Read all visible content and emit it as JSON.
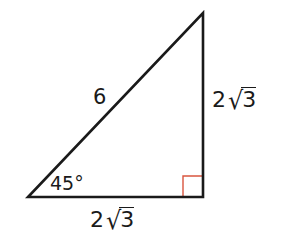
{
  "figure": {
    "type": "right-triangle",
    "vertices": {
      "bottom_left": [
        28,
        197
      ],
      "bottom_right": [
        203,
        197
      ],
      "top": [
        203,
        13
      ]
    },
    "line_color": "#1a1a1a",
    "right_angle_marker_color": "#d9553f",
    "right_angle_marker_size": 20
  },
  "labels": {
    "hypotenuse": "6",
    "angle": "45°",
    "right_side": {
      "coefficient": "2",
      "radical_symbol": "√",
      "radicand": "3"
    },
    "bottom_side": {
      "coefficient": "2",
      "radical_symbol": "√",
      "radicand": "3"
    }
  }
}
